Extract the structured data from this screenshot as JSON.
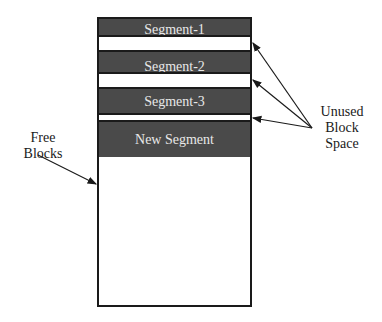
{
  "diagram": {
    "segments": [
      {
        "label": "Segment-1"
      },
      {
        "label": "Segment-2"
      },
      {
        "label": "Segment-3"
      },
      {
        "label": "New Segment"
      }
    ],
    "annotations": {
      "unused": [
        "Unused",
        "Block",
        "Space"
      ],
      "free": [
        "Free",
        "Blocks"
      ]
    },
    "colors": {
      "segment_fill": "#4a4a4a",
      "outline": "#1a1a1a"
    }
  }
}
